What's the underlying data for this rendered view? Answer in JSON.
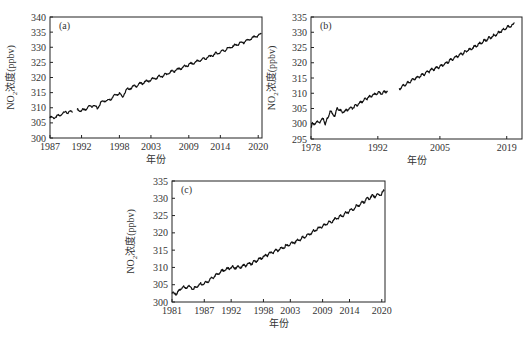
{
  "chart_data": [
    {
      "type": "line",
      "panel_label": "(a)",
      "title": "",
      "xlabel": "年份",
      "ylabel": "NO2浓度(ppbv)",
      "ylabel_parts": {
        "main": "NO",
        "sub": "2",
        "rest": "浓度(ppbv)"
      },
      "xlim": [
        1987,
        2020.6
      ],
      "ylim": [
        300,
        340
      ],
      "x_ticks": [
        1987,
        1992,
        1998,
        2003,
        2009,
        2014,
        2020
      ],
      "y_ticks": [
        300,
        305,
        310,
        315,
        320,
        325,
        330,
        335,
        340
      ],
      "grid": false,
      "series": [
        {
          "name": "NO2",
          "color": "#111111",
          "segments": [
            {
              "x": [
                1987.0,
                1987.5,
                1988.0,
                1988.5,
                1989.0,
                1989.5,
                1990.0,
                1990.6
              ],
              "y": [
                306.8,
                306.7,
                307.0,
                307.4,
                308.2,
                308.6,
                308.5,
                308.6
              ]
            },
            {
              "x": [
                1991.3,
                1992.0,
                1992.5,
                1993.0,
                1993.5,
                1994.0,
                1994.5,
                1995.0,
                1995.5,
                1996.0,
                1996.5,
                1997.0,
                1997.5,
                1998.0,
                1998.5,
                1999.0,
                1999.5,
                2000.0,
                2001.0,
                2002.0,
                2003.0,
                2004.0,
                2005.0,
                2006.0,
                2007.0,
                2008.0,
                2009.0,
                2010.0,
                2011.0,
                2012.0,
                2013.0,
                2014.0,
                2015.0,
                2016.0,
                2017.0,
                2018.0,
                2019.0,
                2020.0,
                2020.5
              ],
              "y": [
                309.3,
                309.1,
                309.2,
                310.2,
                310.6,
                310.8,
                309.6,
                311.6,
                312.3,
                312.4,
                312.7,
                313.8,
                314.4,
                314.9,
                313.5,
                315.6,
                316.3,
                316.8,
                317.6,
                318.5,
                319.2,
                320.0,
                320.7,
                321.6,
                322.5,
                323.3,
                324.2,
                325.0,
                325.9,
                326.6,
                327.6,
                328.4,
                329.4,
                330.3,
                331.2,
                331.9,
                332.9,
                333.9,
                334.4
              ]
            }
          ]
        }
      ]
    },
    {
      "type": "line",
      "panel_label": "(b)",
      "title": "",
      "xlabel": "年份",
      "ylabel": "NO2浓度(ppbv)",
      "ylabel_parts": {
        "main": "NO",
        "sub": "2",
        "rest": "浓度(ppbv)"
      },
      "xlim": [
        1978,
        2022.2
      ],
      "ylim": [
        295,
        335
      ],
      "x_ticks": [
        1978,
        1992,
        2005,
        2019
      ],
      "y_ticks": [
        295,
        300,
        305,
        310,
        315,
        320,
        325,
        330,
        335
      ],
      "grid": false,
      "series": [
        {
          "name": "NO2",
          "color": "#111111",
          "segments": [
            {
              "x": [
                1978.0,
                1978.3,
                1978.6,
                1979.0,
                1980.0,
                1980.6,
                1981.0,
                1981.5,
                1982.0,
                1982.5,
                1983.0,
                1983.5,
                1984.0,
                1984.5,
                1985.0,
                1986.0,
                1987.0,
                1988.0,
                1989.0,
                1990.0,
                1991.0,
                1992.0,
                1993.0,
                1994.0
              ],
              "y": [
                298.5,
                300.2,
                300.0,
                300.4,
                300.8,
                301.8,
                299.6,
                302.0,
                304.1,
                303.2,
                302.6,
                305.2,
                304.4,
                303.8,
                304.0,
                304.9,
                305.4,
                306.6,
                307.7,
                308.6,
                309.5,
                310.0,
                310.1,
                310.8
              ]
            },
            {
              "x": [
                1996.5,
                1997.0,
                1998.0,
                1999.0,
                2000.0,
                2001.0,
                2002.0,
                2003.0,
                2004.0,
                2005.0,
                2006.0,
                2007.0,
                2008.0,
                2009.0,
                2010.0,
                2011.0,
                2012.0,
                2013.0,
                2014.0,
                2015.0,
                2016.0,
                2017.0,
                2018.0,
                2019.0,
                2020.0,
                2020.6
              ],
              "y": [
                311.4,
                312.2,
                313.1,
                314.1,
                315.0,
                315.7,
                316.6,
                317.5,
                318.1,
                318.7,
                319.5,
                320.7,
                321.5,
                322.5,
                323.3,
                324.1,
                325.0,
                325.9,
                326.9,
                327.8,
                328.6,
                329.5,
                330.6,
                331.5,
                332.1,
                333.0
              ]
            }
          ]
        }
      ]
    },
    {
      "type": "line",
      "panel_label": "(c)",
      "title": "",
      "xlabel": "年份",
      "ylabel": "NO2浓度(ppbv)",
      "ylabel_parts": {
        "main": "NO",
        "sub": "2",
        "rest": "浓度(ppbv)"
      },
      "xlim": [
        1981,
        2020.6
      ],
      "ylim": [
        300,
        335
      ],
      "x_ticks": [
        1981,
        1987,
        1992,
        1998,
        2003,
        2009,
        2014,
        2020
      ],
      "y_ticks": [
        300,
        305,
        310,
        315,
        320,
        325,
        330,
        335
      ],
      "grid": false,
      "series": [
        {
          "name": "NO2",
          "color": "#111111",
          "segments": [
            {
              "x": [
                1981.0,
                1982.0,
                1983.0,
                1983.5,
                1984.0,
                1984.5,
                1985.0,
                1985.5,
                1986.0,
                1987.0,
                1988.0,
                1989.0,
                1990.0,
                1991.0,
                1992.0,
                1993.0,
                1994.0,
                1995.0,
                1996.0,
                1997.0,
                1998.0,
                1999.0,
                2000.0,
                2001.0,
                2002.0,
                2003.0,
                2004.0,
                2005.0,
                2006.0,
                2007.0,
                2008.0,
                2009.0,
                2010.0,
                2011.0,
                2012.0,
                2013.0,
                2014.0,
                2015.0,
                2016.0,
                2017.0,
                2018.0,
                2019.0,
                2020.0,
                2020.5
              ],
              "y": [
                302.3,
                302.6,
                304.4,
                304.0,
                304.6,
                304.2,
                303.7,
                304.3,
                305.0,
                305.3,
                306.4,
                307.6,
                308.7,
                309.4,
                310.0,
                310.0,
                310.3,
                310.8,
                311.3,
                312.2,
                313.1,
                313.9,
                314.6,
                315.2,
                316.0,
                316.8,
                317.5,
                318.3,
                319.1,
                320.1,
                321.2,
                321.9,
                322.8,
                323.6,
                324.5,
                325.3,
                326.4,
                327.3,
                328.3,
                329.4,
                330.4,
                330.8,
                331.3,
                332.3
              ]
            }
          ]
        }
      ]
    }
  ]
}
